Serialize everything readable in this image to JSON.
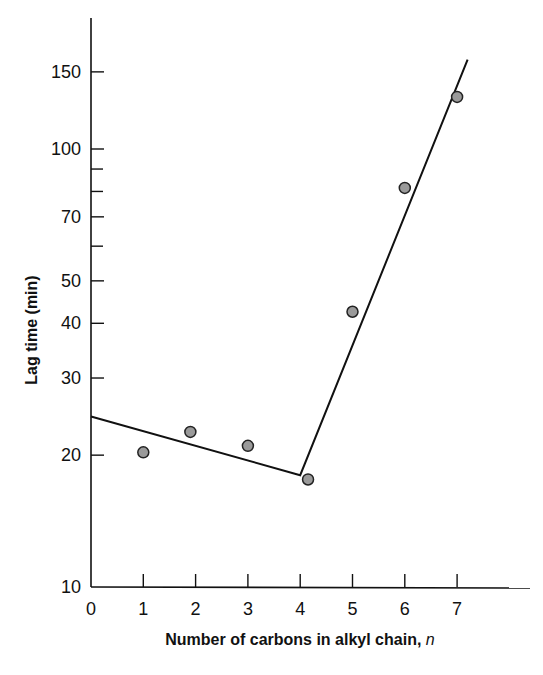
{
  "chart_data": {
    "type": "scatter",
    "title": "",
    "xlabel": "Number of carbons in alkyl chain,",
    "xlabel_italic_suffix": "n",
    "ylabel": "Lag time (min)",
    "yscale": "log",
    "xlim": [
      0,
      8
    ],
    "ylim": [
      10,
      180
    ],
    "grid": false,
    "legend": null,
    "x_ticks": [
      0,
      1,
      2,
      3,
      4,
      5,
      6,
      7
    ],
    "x_tick_labels": [
      "0",
      "1",
      "2",
      "3",
      "4",
      "5",
      "6",
      "7"
    ],
    "y_ticks_labeled": [
      10,
      20,
      30,
      40,
      50,
      70,
      100,
      150
    ],
    "y_tick_labels": [
      "10",
      "20",
      "30",
      "40",
      "50",
      "70",
      "100",
      "150"
    ],
    "y_ticks_minor": [
      60,
      80,
      90
    ],
    "series": [
      {
        "name": "data points",
        "kind": "scatter",
        "x": [
          1,
          1.9,
          3,
          4.15,
          5,
          6,
          7
        ],
        "y": [
          20.3,
          22.6,
          21.0,
          17.6,
          42.5,
          81.5,
          131.5
        ],
        "marker_fill": "#9a9a9a",
        "marker_stroke": "#222222"
      },
      {
        "name": "fit line",
        "kind": "line",
        "x": [
          0,
          4,
          7.2
        ],
        "y": [
          24.5,
          18.0,
          160
        ],
        "color": "#111111"
      }
    ]
  }
}
